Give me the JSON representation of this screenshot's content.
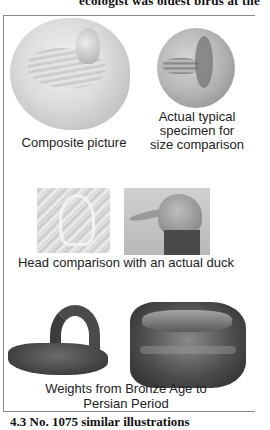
{
  "page": {
    "top_text_fragment": "ecologist was oldest birds at the",
    "bottom_text_fragment": "4.3   No. 1075 similar illustrations"
  },
  "figure": {
    "panels": [
      {
        "id": "composite",
        "caption": "Composite picture",
        "image": "duck-seal-composite"
      },
      {
        "id": "specimen",
        "caption": "Actual typical specimen for size comparison",
        "caption_lines": [
          "Actual typical",
          "specimen for",
          "size comparison"
        ],
        "image": "duck-seal-actual"
      },
      {
        "id": "head",
        "caption": "Head comparison with an actual duck",
        "images": [
          "seal-head-closeup",
          "duck-head-photo"
        ]
      },
      {
        "id": "weights",
        "caption": "Weights from Bronze Age to Persian Period",
        "caption_lines": [
          "Weights from Bronze Age to",
          "Persian Period"
        ],
        "images": [
          "bronze-age-duck-weight",
          "persian-duck-weight"
        ]
      }
    ]
  }
}
